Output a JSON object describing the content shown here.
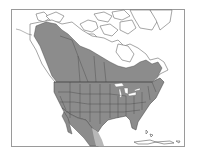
{
  "map": {
    "type": "species-range-map",
    "region": "North America",
    "frame": {
      "x": 11,
      "y": 9,
      "width": 174,
      "height": 138
    },
    "colors": {
      "background": "#ffffff",
      "frame": "#9a9a9a",
      "land_outside_range": "#ffffff",
      "range_fill": "#8c8c8c",
      "range_light_fill": "#b8b8b8",
      "borders": "#3a3a3a",
      "coastline": "#6a6a6a",
      "water_lakes": "#ffffff"
    },
    "legend": []
  }
}
